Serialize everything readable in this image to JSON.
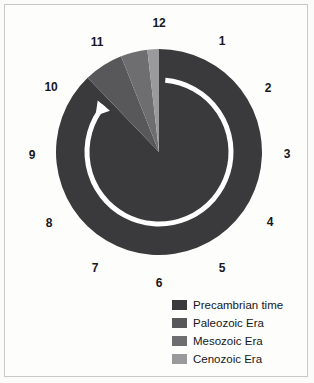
{
  "figure": {
    "kind": "geologic-time-clock-pie-chart",
    "background_color": "#fdfdfc",
    "frame_color": "#c9c9c9"
  },
  "clock": {
    "center_x": 159,
    "center_y": 152,
    "radius": 103,
    "hour_label_radius": 124,
    "hours": [
      {
        "label": "12",
        "angle_deg": 0,
        "x": 159,
        "y": 23
      },
      {
        "label": "1",
        "angle_deg": 30,
        "x": 222,
        "y": 41
      },
      {
        "label": "2",
        "angle_deg": 60,
        "x": 268,
        "y": 88
      },
      {
        "label": "3",
        "angle_deg": 90,
        "x": 287,
        "y": 154
      },
      {
        "label": "4",
        "angle_deg": 120,
        "x": 270,
        "y": 222
      },
      {
        "label": "5",
        "angle_deg": 150,
        "x": 222,
        "y": 268
      },
      {
        "label": "6",
        "angle_deg": 180,
        "x": 159,
        "y": 283
      },
      {
        "label": "7",
        "angle_deg": 210,
        "x": 95,
        "y": 268
      },
      {
        "label": "8",
        "angle_deg": 240,
        "x": 49,
        "y": 223
      },
      {
        "label": "9",
        "angle_deg": 270,
        "x": 32,
        "y": 155
      },
      {
        "label": "10",
        "angle_deg": 300,
        "x": 51,
        "y": 87
      },
      {
        "label": "11",
        "angle_deg": 330,
        "x": 97,
        "y": 42
      }
    ]
  },
  "direction_arrow": {
    "name": "time-direction-arrow",
    "color": "#ffffff",
    "description": "white counter-clockwise-drawn ring arrow ending with arrowhead near 10 o'clock",
    "ring_radius": 72,
    "stroke_width": 5,
    "start_angle_deg": 5,
    "end_angle_deg": 310,
    "arrowhead_x": 104,
    "arrowhead_y": 100
  },
  "chart_data": {
    "type": "pie",
    "title": "",
    "subtitle": "",
    "xlabel": "",
    "ylabel": "",
    "legend_position": "bottom-right",
    "start_angle_deg": 0,
    "direction": "clockwise",
    "categories": [
      "Precambrian time",
      "Paleozoic Era",
      "Mesozoic Era",
      "Cenozoic Era"
    ],
    "values": [
      87.8,
      6.2,
      4.2,
      1.8
    ],
    "unit": "percent of geologic time",
    "colors": [
      "#3a3a3c",
      "#58585a",
      "#6e6e70",
      "#9a9a9c"
    ],
    "slices": [
      {
        "name": "Precambrian time",
        "value": 87.8,
        "color": "#3a3a3c",
        "start_angle_deg": 0,
        "end_angle_deg": 316.1
      },
      {
        "name": "Paleozoic Era",
        "value": 6.2,
        "color": "#58585a",
        "start_angle_deg": 316.1,
        "end_angle_deg": 338.4
      },
      {
        "name": "Mesozoic Era",
        "value": 4.2,
        "color": "#6e6e70",
        "start_angle_deg": 338.4,
        "end_angle_deg": 353.5
      },
      {
        "name": "Cenozoic Era",
        "value": 1.8,
        "color": "#9a9a9c",
        "start_angle_deg": 353.5,
        "end_angle_deg": 360
      }
    ]
  },
  "legend": {
    "items": [
      {
        "label": "Precambrian time",
        "color": "#3a3a3c"
      },
      {
        "label": "Paleozoic Era",
        "color": "#58585a"
      },
      {
        "label": "Mesozoic Era",
        "color": "#6e6e70"
      },
      {
        "label": "Cenozoic Era",
        "color": "#9a9a9c"
      }
    ]
  }
}
